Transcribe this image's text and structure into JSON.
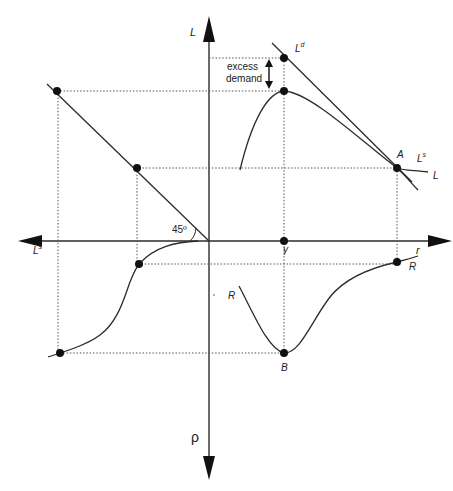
{
  "diagram": {
    "type": "four-quadrant economics diagram",
    "colors": {
      "line": "#2b2b2b",
      "dotted": "#555555",
      "background": "#ffffff"
    },
    "axes": {
      "up_label": "L",
      "down_label": "ρ",
      "left_label": "Ls",
      "left_label_base": "L",
      "left_label_sup": "s",
      "right_label": "r"
    },
    "curves": {
      "demand_label_base": "L",
      "demand_label_sup": "d",
      "supply_label_base": "L",
      "supply_label_sup": "s",
      "loan_curve_label": "L",
      "r_curve_label_right": "R",
      "r_curve_label_lower": "R"
    },
    "points": {
      "A": "A",
      "B": "B",
      "r_bar": "γ"
    },
    "annotations": {
      "excess_line1": "excess",
      "excess_line2": "demand",
      "angle": "45º"
    }
  }
}
